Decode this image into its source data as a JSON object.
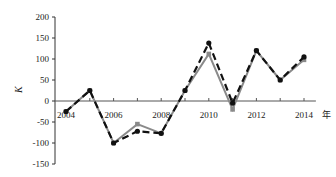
{
  "chart_data": {
    "type": "line",
    "title": "",
    "xlabel": "年",
    "ylabel": "K",
    "x": [
      2004,
      2005,
      2006,
      2007,
      2008,
      2009,
      2010,
      2011,
      2012,
      2013,
      2014
    ],
    "x_tick_labels": [
      "2004",
      "2006",
      "2008",
      "2010",
      "2012",
      "2014"
    ],
    "y_tick_labels": [
      "200",
      "150",
      "100",
      "50",
      "0",
      "-50",
      "-100",
      "-150"
    ],
    "ylim": [
      -150,
      200
    ],
    "xlim": [
      2003.5,
      2014.5
    ],
    "grid": false,
    "legend": null,
    "series": [
      {
        "name": "series-black-dashed",
        "style": "dashed",
        "color": "#111111",
        "marker": "circle",
        "values": [
          -25,
          25,
          -100,
          -72,
          -77,
          25,
          138,
          -5,
          120,
          50,
          105
        ]
      },
      {
        "name": "series-gray-solid",
        "style": "solid",
        "color": "#8a8a8a",
        "marker": "square",
        "values": [
          -25,
          25,
          -100,
          -55,
          -77,
          25,
          112,
          -20,
          120,
          50,
          98
        ]
      }
    ]
  }
}
